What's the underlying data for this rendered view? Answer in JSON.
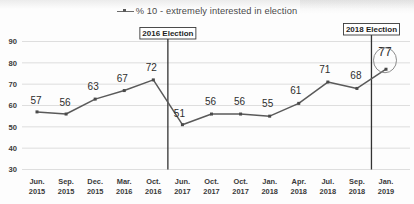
{
  "legend": {
    "marker_icon": "line-marker-icon",
    "label": "% 10 - extremely interested in election"
  },
  "annotations": [
    {
      "label": "2016 Election",
      "at_category": "Oct. 2016"
    },
    {
      "label": "2018 Election",
      "at_category": "Sep. 2018"
    }
  ],
  "highlight": {
    "value_label": "77",
    "shape": "ellipse-circle-icon"
  },
  "axis": {
    "y_ticks": [
      "90",
      "80",
      "70",
      "60",
      "50",
      "40",
      "30"
    ],
    "x_ticks": [
      {
        "line1": "Jun.",
        "line2": "2015"
      },
      {
        "line1": "Sep.",
        "line2": "2015"
      },
      {
        "line1": "Dec.",
        "line2": "2015"
      },
      {
        "line1": "Mar.",
        "line2": "2016"
      },
      {
        "line1": "Oct.",
        "line2": "2016"
      },
      {
        "line1": "Jun.",
        "line2": "2017"
      },
      {
        "line1": "Oct.",
        "line2": "2017"
      },
      {
        "line1": "Oct.",
        "line2": "2017"
      },
      {
        "line1": "Jan.",
        "line2": "2018"
      },
      {
        "line1": "Apr.",
        "line2": "2018"
      },
      {
        "line1": "Jul.",
        "line2": "2018"
      },
      {
        "line1": "Sep.",
        "line2": "2018"
      },
      {
        "line1": "Jan.",
        "line2": "2019"
      }
    ]
  },
  "colors": {
    "series_line": "#5a5a5a",
    "gridline": "#d6d6d6",
    "annotation_line": "#333333",
    "text": "#2e2e2e",
    "background": "#fdfdfd"
  },
  "chart_data": {
    "type": "line",
    "title": "",
    "subtitle": "",
    "xlabel": "",
    "ylabel": "",
    "ylim": [
      30,
      90
    ],
    "grid": true,
    "legend_position": "top-center",
    "categories": [
      "Jun. 2015",
      "Sep. 2015",
      "Dec. 2015",
      "Mar. 2016",
      "Oct. 2016",
      "Jun. 2017",
      "Oct. 2017",
      "Oct. 2017",
      "Jan. 2018",
      "Apr. 2018",
      "Jul. 2018",
      "Sep. 2018",
      "Jan. 2019"
    ],
    "series": [
      {
        "name": "% 10 - extremely interested in election",
        "values": [
          57,
          56,
          63,
          67,
          72,
          51,
          56,
          56,
          55,
          61,
          71,
          68,
          77
        ]
      }
    ],
    "data_labels": [
      "57",
      "56",
      "63",
      "67",
      "72",
      "51",
      "56",
      "56",
      "55",
      "61",
      "71",
      "68",
      "77"
    ],
    "annotations": [
      {
        "text": "2016 Election",
        "type": "vertical-line-box",
        "between": [
          "Oct. 2016",
          "Jun. 2017"
        ]
      },
      {
        "text": "2018 Election",
        "type": "vertical-line-box",
        "between": [
          "Sep. 2018",
          "Jan. 2019"
        ]
      },
      {
        "text": "77",
        "type": "circled-point",
        "at": "Jan. 2019"
      }
    ],
    "y_ticks": [
      30,
      40,
      50,
      60,
      70,
      80,
      90
    ]
  }
}
